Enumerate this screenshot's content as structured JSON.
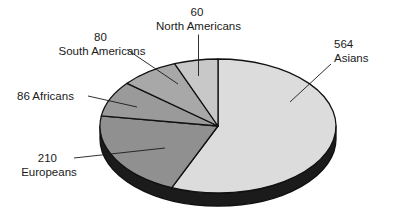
{
  "figure": {
    "background_color": "#ffffff",
    "width": 393,
    "height": 218
  },
  "chart_data": {
    "type": "pie",
    "title": "",
    "subtitle": "",
    "xlabel": "",
    "ylabel": "",
    "legend_position": "none",
    "grid": false,
    "style": "3d-pie-grayscale",
    "total": 1000,
    "start_angle_deg": 0,
    "direction": "clockwise",
    "categories": [
      "Asians",
      "Europeans",
      "Africans",
      "South Americans",
      "North Americans"
    ],
    "values": [
      564,
      210,
      86,
      80,
      60
    ],
    "slices": [
      {
        "label": "Asians",
        "value": 564,
        "value_text": "564",
        "name_text": "Asians",
        "percent": 56.4,
        "angle_deg": 203.04,
        "color": "#dcdcdc",
        "side_color": "#1b1b1b",
        "label_lines": [
          "564",
          "Asians"
        ],
        "label_align": "start"
      },
      {
        "label": "Europeans",
        "value": 210,
        "value_text": "210",
        "name_text": "Europeans",
        "percent": 21.0,
        "angle_deg": 75.6,
        "color": "#909090",
        "side_color": "#1b1b1b",
        "label_lines": [
          "210",
          "Europeans"
        ],
        "label_align": "middle"
      },
      {
        "label": "Africans",
        "value": 86,
        "value_text": "86",
        "name_text": "Africans",
        "percent": 8.6,
        "angle_deg": 30.96,
        "color": "#9a9a9a",
        "side_color": "#1b1b1b",
        "label_lines": [
          "86 Africans"
        ],
        "label_align": "start"
      },
      {
        "label": "South Americans",
        "value": 80,
        "value_text": "80",
        "name_text": "South Americans",
        "percent": 8.0,
        "angle_deg": 28.8,
        "color": "#a8a8a8",
        "side_color": "#1b1b1b",
        "label_lines": [
          "80",
          "South Americans"
        ],
        "label_align": "middle"
      },
      {
        "label": "North Americans",
        "value": 60,
        "value_text": "60",
        "name_text": "North Americans",
        "percent": 6.0,
        "angle_deg": 21.6,
        "color": "#c8c8c8",
        "side_color": "#1b1b1b",
        "label_lines": [
          "60",
          "North Americans"
        ],
        "label_align": "middle"
      }
    ]
  },
  "labels": {
    "asians": {
      "line1": "564",
      "line2": "Asians"
    },
    "europeans": {
      "line1": "210",
      "line2": "Europeans"
    },
    "africans": {
      "line1": "86 Africans"
    },
    "south_americans": {
      "line1": "80",
      "line2": "South Americans"
    },
    "north_americans": {
      "line1": "60",
      "line2": "North Americans"
    }
  }
}
